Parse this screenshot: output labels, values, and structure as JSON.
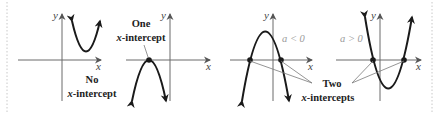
{
  "figure": {
    "border_color": "#c8c8c8",
    "axis_color": "#6a6a6a",
    "curve_color": "#1a1a1a",
    "pointer_color": "#7a7a7a",
    "panels": [
      {
        "id": "no-intercept",
        "axis_x_label": "x",
        "axis_y_label": "y",
        "parabola": "opens-up",
        "intercept_count": 0,
        "caption_line1": "No",
        "caption_line2_var": "x",
        "caption_line2_rest": "-intercept"
      },
      {
        "id": "one-intercept",
        "axis_x_label": "x",
        "axis_y_label": "y",
        "parabola": "opens-down",
        "intercept_count": 1,
        "caption_line1": "One",
        "caption_line2_var": "x",
        "caption_line2_rest": "-intercept"
      },
      {
        "id": "two-intercepts-a-neg",
        "axis_x_label": "x",
        "axis_y_label": "y",
        "parabola": "opens-down",
        "intercept_count": 2,
        "condition": "a < 0"
      },
      {
        "id": "two-intercepts-a-pos",
        "axis_x_label": "x",
        "axis_y_label": "y",
        "parabola": "opens-up",
        "intercept_count": 2,
        "condition": "a > 0"
      }
    ],
    "shared_caption": {
      "line1": "Two",
      "line2_var": "x",
      "line2_rest": "-intercepts"
    }
  }
}
